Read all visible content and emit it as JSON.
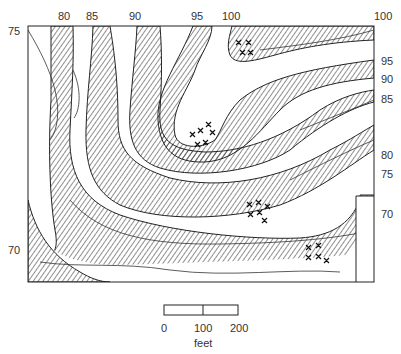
{
  "map": {
    "title": "",
    "contour_labels_top": [
      {
        "value": "80",
        "x": 58
      },
      {
        "value": "85",
        "x": 86
      },
      {
        "value": "90",
        "x": 129
      },
      {
        "value": "95",
        "x": 191
      },
      {
        "value": "100",
        "x": 222
      },
      {
        "value": "100",
        "x": 374
      }
    ],
    "contour_labels_left": [
      {
        "value": "75",
        "y": 24
      },
      {
        "value": "70",
        "y": 243
      }
    ],
    "contour_labels_right": [
      {
        "value": "95",
        "y": 54
      },
      {
        "value": "90",
        "y": 72
      },
      {
        "value": "85",
        "y": 92
      },
      {
        "value": "80",
        "y": 148
      },
      {
        "value": "75",
        "y": 167
      },
      {
        "value": "70",
        "y": 207
      }
    ],
    "scale_bar": {
      "ticks": [
        "0",
        "100",
        "200"
      ],
      "unit": "feet"
    },
    "colors": {
      "line": "#222222",
      "background": "#ffffff"
    }
  }
}
